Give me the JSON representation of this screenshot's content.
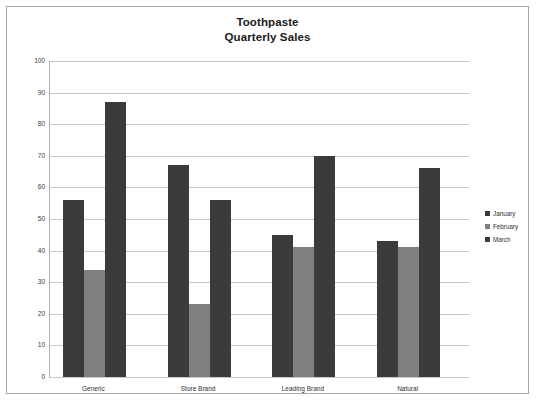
{
  "chart_data": {
    "type": "bar",
    "title": "Toothpaste Quarterly Sales",
    "title_lines": [
      "Toothpaste",
      "Quarterly Sales"
    ],
    "xlabel": "",
    "ylabel": "",
    "ylim": [
      0,
      100
    ],
    "ytick_step": 10,
    "yticks": [
      "100",
      "90",
      "80",
      "70",
      "60",
      "50",
      "40",
      "30",
      "20",
      "10",
      "0"
    ],
    "grid": true,
    "legend_position": "right",
    "categories": [
      "Generic",
      "Store Brand",
      "Leading Brand",
      "Natural"
    ],
    "series": [
      {
        "name": "January",
        "values": [
          56,
          67,
          45,
          43
        ],
        "color": "#3b3b3b"
      },
      {
        "name": "February",
        "values": [
          34,
          23,
          41,
          41
        ],
        "color": "#7f7f7f"
      },
      {
        "name": "March",
        "values": [
          87,
          56,
          70,
          66
        ],
        "color": "#3b3b3b"
      }
    ]
  },
  "frame": {
    "border_color": "#a6a6a6",
    "background": "#ffffff",
    "gridline_color": "#c8c8c8",
    "axis_color": "#b3b3b3"
  }
}
